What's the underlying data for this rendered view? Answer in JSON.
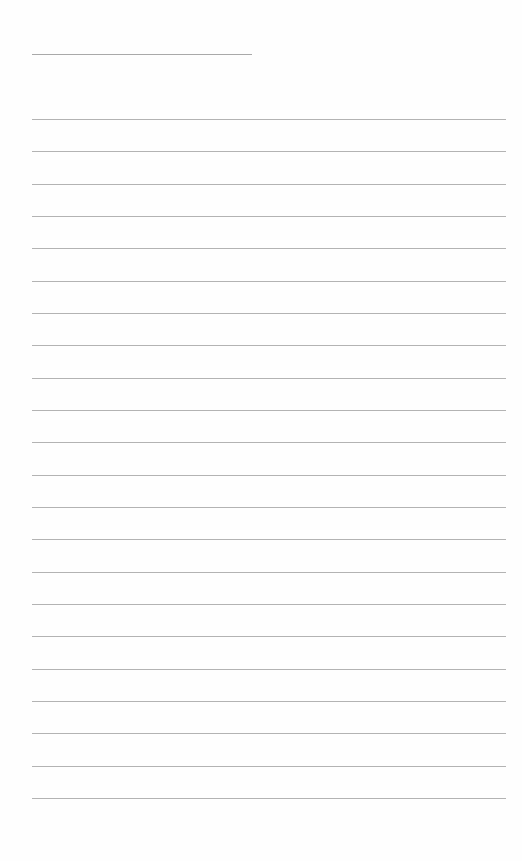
{
  "document": {
    "type": "blank lined paper",
    "title_line": {
      "x": 32,
      "y": 54,
      "width": 220
    },
    "ruled_lines": {
      "count": 22,
      "start_y": 119,
      "spacing": 32.33,
      "x": 32,
      "width": 474
    },
    "colors": {
      "background": "#fefefe",
      "line": "#b3b3b3",
      "title_line": "#a9a9a9"
    }
  }
}
